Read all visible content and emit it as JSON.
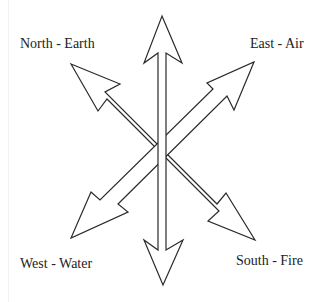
{
  "diagram": {
    "title": "",
    "labels": {
      "north": "North - Earth",
      "east": "East - Air",
      "west": "West - Water",
      "south": "South - Fire"
    },
    "arrows": [
      {
        "direction": "up",
        "name": "vertical-top"
      },
      {
        "direction": "down",
        "name": "vertical-bottom"
      },
      {
        "direction": "up-left",
        "name": "north-earth"
      },
      {
        "direction": "up-right",
        "name": "east-air"
      },
      {
        "direction": "down-left",
        "name": "west-water"
      },
      {
        "direction": "down-right",
        "name": "south-fire"
      }
    ],
    "colors": {
      "stroke": "#2a2a2a",
      "fill": "#ffffff",
      "text": "#222222"
    }
  }
}
